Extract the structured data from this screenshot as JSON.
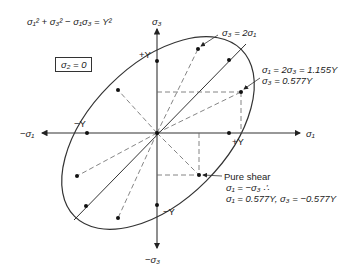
{
  "equation": "σ₁² + σ₃² − σ₁σ₃ = Y²",
  "condition_box": "σ₂ = 0",
  "axes": {
    "x_pos": "σ₁",
    "x_neg": "−σ₁",
    "y_pos": "σ₃",
    "y_neg": "−σ₃"
  },
  "intercepts": {
    "y_top": "+Y",
    "y_bottom": "−Y",
    "x_left": "−Y",
    "x_right": "+Y"
  },
  "annotations": {
    "sigma3_eq_2sigma1": "σ₃ = 2σ₁",
    "sigma1_eq_2sigma3_line1": "σ₁ = 2σ₃ = 1.155Y",
    "sigma1_eq_2sigma3_line2": "σ₃ = 0.577Y",
    "pure_shear_title": "Pure shear",
    "pure_shear_line1": "σ₁ = −σ₃ ∴",
    "pure_shear_line2": "σ₁ = 0.577Y, σ₃ = −0.577Y"
  },
  "colors": {
    "line": "#333333",
    "dash": "#555555"
  }
}
